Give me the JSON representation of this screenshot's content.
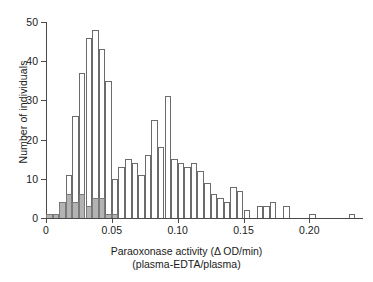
{
  "chart_data": {
    "type": "bar",
    "title": "",
    "xlabel": "Paraoxonase activity (Δ OD/min)",
    "xlabel_line2": "(plasma-EDTA/plasma)",
    "ylabel": "Number of individuals",
    "xlim": [
      0,
      0.24
    ],
    "ylim": [
      0,
      50
    ],
    "bin_width": 0.005,
    "grid": false,
    "legend": "none",
    "xticks": [
      0,
      0.05,
      0.1,
      0.15,
      0.2
    ],
    "xtick_labels": [
      "0",
      "0.05",
      "0.10",
      "0.15",
      "0.20"
    ],
    "yticks": [
      0,
      10,
      20,
      30,
      40,
      50
    ],
    "ytick_labels": [
      "0",
      "10",
      "20",
      "30",
      "40",
      "50"
    ],
    "bin_starts": [
      0.0,
      0.005,
      0.01,
      0.015,
      0.02,
      0.025,
      0.03,
      0.035,
      0.04,
      0.045,
      0.05,
      0.055,
      0.06,
      0.065,
      0.07,
      0.075,
      0.08,
      0.085,
      0.09,
      0.095,
      0.1,
      0.105,
      0.11,
      0.115,
      0.12,
      0.125,
      0.13,
      0.135,
      0.14,
      0.145,
      0.15,
      0.155,
      0.16,
      0.165,
      0.17,
      0.175,
      0.18,
      0.185,
      0.19,
      0.195,
      0.2,
      0.205,
      0.21,
      0.215,
      0.22,
      0.225,
      0.23,
      0.235
    ],
    "series": [
      {
        "name": "All individuals",
        "style": "open",
        "color": "#ffffff",
        "edge": "#6b6b6b",
        "values": [
          1,
          1,
          4,
          11,
          26,
          37,
          46,
          48,
          43,
          35,
          10,
          13,
          15,
          14,
          11,
          16,
          25,
          18,
          31,
          15,
          14,
          13,
          14,
          12,
          9,
          6,
          5,
          4,
          8,
          7,
          2,
          0,
          3,
          3,
          4,
          0,
          3,
          0,
          0,
          0,
          1,
          0,
          0,
          0,
          0,
          0,
          1,
          0
        ]
      },
      {
        "name": "Low-activity subset (shaded)",
        "style": "shaded",
        "color": "#b3b3b3",
        "edge": "#7a7a7a",
        "values": [
          1,
          1,
          4,
          6,
          4,
          6,
          3,
          5,
          5,
          1,
          1,
          0,
          0,
          0,
          0,
          0,
          0,
          0,
          0,
          0,
          0,
          0,
          0,
          0,
          0,
          0,
          0,
          0,
          0,
          0,
          0,
          0,
          0,
          0,
          0,
          0,
          0,
          0,
          0,
          0,
          0,
          0,
          0,
          0,
          0,
          0,
          0,
          0
        ]
      }
    ]
  }
}
